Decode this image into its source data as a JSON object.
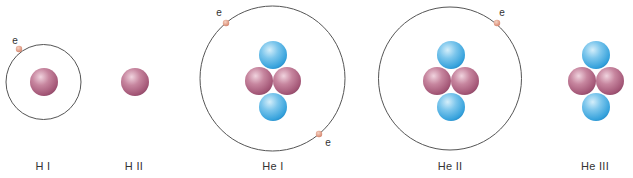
{
  "figure": {
    "title": "",
    "colors": {
      "orbit": "#555555",
      "proton_base": "#a85c7c",
      "proton_highlight": "#f0d3de",
      "proton_shadow": "#7e3d5a",
      "neutron_base": "#3aa6de",
      "neutron_highlight": "#d4eefa",
      "neutron_shadow": "#1f84c0",
      "electron_base": "#d98a6e",
      "electron_highlight": "#f6d3c3"
    },
    "electron_symbol": "e",
    "species": [
      {
        "id": "H-I",
        "label": "H I",
        "label_x": 43,
        "orbit": {
          "cx": 43.5,
          "cy": 82,
          "r": 37.5
        },
        "protons": [
          {
            "cx": 44,
            "cy": 82
          }
        ],
        "neutrons": [],
        "electrons": [
          {
            "cx": 19,
            "cy": 49,
            "label_x": 15,
            "label_y": 40
          }
        ]
      },
      {
        "id": "H-II",
        "label": "H II",
        "label_x": 134,
        "orbit": null,
        "protons": [
          {
            "cx": 135,
            "cy": 82
          }
        ],
        "neutrons": [],
        "electrons": []
      },
      {
        "id": "He-I",
        "label": "He I",
        "label_x": 273,
        "orbit": {
          "cx": 272.5,
          "cy": 78.5,
          "r": 72.5
        },
        "protons": [
          {
            "cx": 259,
            "cy": 81
          },
          {
            "cx": 287,
            "cy": 81
          }
        ],
        "neutrons": [
          {
            "cx": 273,
            "cy": 55
          },
          {
            "cx": 273,
            "cy": 107
          }
        ],
        "electrons": [
          {
            "cx": 226,
            "cy": 23,
            "label_x": 219,
            "label_y": 12
          },
          {
            "cx": 319,
            "cy": 134,
            "label_x": 328,
            "label_y": 142
          }
        ]
      },
      {
        "id": "He-II",
        "label": "He II",
        "label_x": 450,
        "orbit": {
          "cx": 450,
          "cy": 78.5,
          "r": 71.5
        },
        "protons": [
          {
            "cx": 437,
            "cy": 81
          },
          {
            "cx": 465,
            "cy": 81
          }
        ],
        "neutrons": [
          {
            "cx": 451,
            "cy": 55
          },
          {
            "cx": 451,
            "cy": 107
          }
        ],
        "electrons": [
          {
            "cx": 497,
            "cy": 23,
            "label_x": 502,
            "label_y": 12
          }
        ]
      },
      {
        "id": "He-III",
        "label": "He III",
        "label_x": 595,
        "orbit": null,
        "protons": [
          {
            "cx": 582,
            "cy": 81
          },
          {
            "cx": 610,
            "cy": 81
          }
        ],
        "neutrons": [
          {
            "cx": 596,
            "cy": 55
          },
          {
            "cx": 596,
            "cy": 107
          }
        ],
        "electrons": []
      }
    ],
    "particle_radius": {
      "nucleon": 14,
      "electron": 3.2
    }
  }
}
